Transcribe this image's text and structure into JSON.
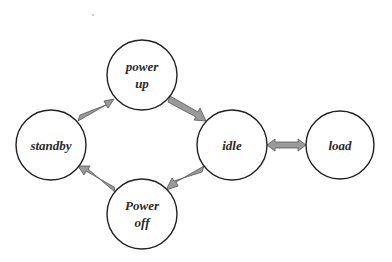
{
  "diagram": {
    "type": "state-transition",
    "colors": {
      "background": "#ffffff",
      "node_stroke": "#222222",
      "node_fill": "#ffffff",
      "arrow_fill": "#9a9a9a",
      "arrow_stroke": "#555555",
      "text": "#2a2a2a"
    },
    "nodes": [
      {
        "id": "power_up",
        "lines": [
          "power",
          "up"
        ],
        "cx": 142,
        "cy": 75,
        "r": 35
      },
      {
        "id": "standby",
        "lines": [
          "standby"
        ],
        "cx": 51,
        "cy": 145,
        "r": 35
      },
      {
        "id": "idle",
        "lines": [
          "idle"
        ],
        "cx": 232,
        "cy": 145,
        "r": 35
      },
      {
        "id": "load",
        "lines": [
          "load"
        ],
        "cx": 340,
        "cy": 145,
        "r": 34
      },
      {
        "id": "power_off",
        "lines": [
          "Power",
          "off"
        ],
        "cx": 142,
        "cy": 214,
        "r": 35
      }
    ],
    "edges": [
      {
        "from": "standby",
        "to": "power_up",
        "direction": "forward"
      },
      {
        "from": "power_up",
        "to": "idle",
        "direction": "forward"
      },
      {
        "from": "idle",
        "to": "power_off",
        "direction": "forward"
      },
      {
        "from": "power_off",
        "to": "standby",
        "direction": "forward"
      },
      {
        "from": "idle",
        "to": "load",
        "direction": "bidirectional"
      }
    ]
  },
  "labels": {
    "power_up_line1": "power",
    "power_up_line2": "up",
    "standby": "standby",
    "idle": "idle",
    "load": "load",
    "power_off_line1": "Power",
    "power_off_line2": "off"
  }
}
